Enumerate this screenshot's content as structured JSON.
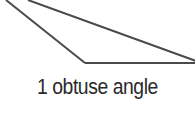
{
  "diagram": {
    "shape": "triangle",
    "stroke_color": "#4a4a4a",
    "vertices_visible": [
      [
        85,
        63
      ],
      [
        195,
        62
      ]
    ],
    "caption": "1 obtuse angle"
  }
}
